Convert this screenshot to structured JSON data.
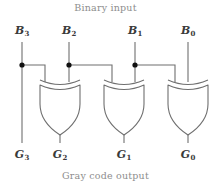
{
  "figure": {
    "title_top": "Binary input",
    "title_bottom": "Gray code output",
    "wire_color": "#6f6f6f",
    "gate_color": "#6f6f6f",
    "dot_color": "#111111",
    "label_color": "#3a3a3a",
    "caption_color": "#8d8d8d",
    "background": "#ffffff"
  },
  "inputs": [
    {
      "name": "B3",
      "base": "B",
      "sub": "3",
      "x": 22
    },
    {
      "name": "B2",
      "base": "B",
      "sub": "2",
      "x": 69
    },
    {
      "name": "B1",
      "base": "B",
      "sub": "1",
      "x": 135
    },
    {
      "name": "B0",
      "base": "B",
      "sub": "0",
      "x": 188
    }
  ],
  "outputs": [
    {
      "name": "G3",
      "base": "G",
      "sub": "3",
      "x": 22
    },
    {
      "name": "G2",
      "base": "G",
      "sub": "2",
      "x": 60
    },
    {
      "name": "G1",
      "base": "G",
      "sub": "1",
      "x": 124
    },
    {
      "name": "G0",
      "base": "G",
      "sub": "0",
      "x": 188
    }
  ],
  "gates": [
    {
      "name": "xor-gate-g2",
      "type": "XOR",
      "cx": 60,
      "left_input": "B3",
      "right_input": "B2",
      "output": "G2"
    },
    {
      "name": "xor-gate-g1",
      "type": "XOR",
      "cx": 124,
      "left_input": "B2",
      "right_input": "B1",
      "output": "G1"
    },
    {
      "name": "xor-gate-g0",
      "type": "XOR",
      "cx": 188,
      "left_input": "B1",
      "right_input": "B0",
      "output": "G0"
    }
  ],
  "junctions": [
    {
      "name": "junction-b3",
      "x": 22,
      "y": 65
    },
    {
      "name": "junction-b2",
      "x": 69,
      "y": 65
    },
    {
      "name": "junction-b1",
      "x": 135,
      "y": 65
    }
  ]
}
